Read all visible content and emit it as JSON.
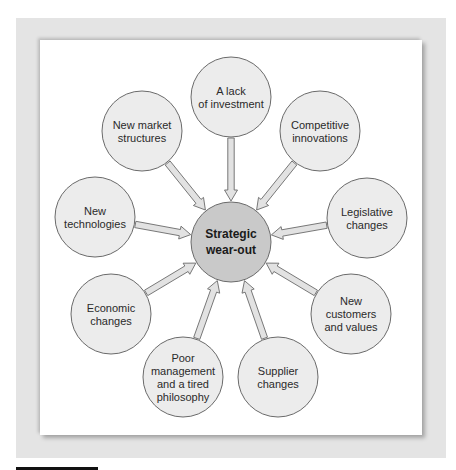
{
  "diagram": {
    "center": {
      "label_lines": [
        "Strategic",
        "wear-out"
      ],
      "cx": 231,
      "cy": 242,
      "r": 40,
      "fill": "#c9c9c9"
    },
    "node_fill": "#ececec",
    "arrow_fill": "#e2e2e2",
    "stroke_color": "#6a6a6a",
    "nodes": [
      {
        "id": "lack-of-investment",
        "label_lines": [
          "A lack",
          "of investment"
        ],
        "cx": 231,
        "cy": 97,
        "r": 40
      },
      {
        "id": "competitive-innovations",
        "label_lines": [
          "Competitive",
          "innovations"
        ],
        "cx": 320,
        "cy": 131,
        "r": 40
      },
      {
        "id": "legislative-changes",
        "label_lines": [
          "Legislative",
          "changes"
        ],
        "cx": 367,
        "cy": 218,
        "r": 40
      },
      {
        "id": "new-customers-and-values",
        "label_lines": [
          "New",
          "customers",
          "and values"
        ],
        "cx": 351,
        "cy": 314,
        "r": 40
      },
      {
        "id": "supplier-changes",
        "label_lines": [
          "Supplier",
          "changes"
        ],
        "cx": 278,
        "cy": 377,
        "r": 40
      },
      {
        "id": "poor-management",
        "label_lines": [
          "Poor",
          "management",
          "and a tired",
          "philosophy"
        ],
        "cx": 183,
        "cy": 377,
        "r": 40
      },
      {
        "id": "economic-changes",
        "label_lines": [
          "Economic",
          "changes"
        ],
        "cx": 111,
        "cy": 314,
        "r": 40
      },
      {
        "id": "new-technologies",
        "label_lines": [
          "New",
          "technologies"
        ],
        "cx": 95,
        "cy": 217,
        "r": 40
      },
      {
        "id": "new-market-structures",
        "label_lines": [
          "New market",
          "structures"
        ],
        "cx": 142,
        "cy": 131,
        "r": 40
      }
    ],
    "edges_direction": "node-to-center"
  }
}
